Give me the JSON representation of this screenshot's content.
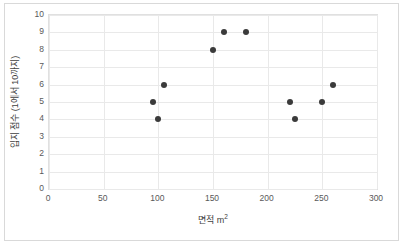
{
  "chart_data": {
    "type": "scatter",
    "title": "",
    "xlabel": "면적 m²",
    "xlabel_base": "면적 m",
    "xlabel_sup": "2",
    "ylabel": "입지 점수 (1에서 10까지)",
    "xlim": [
      0,
      300
    ],
    "ylim": [
      0,
      10
    ],
    "xticks": [
      0,
      50,
      100,
      150,
      200,
      250,
      300
    ],
    "yticks": [
      0,
      1,
      2,
      3,
      4,
      5,
      6,
      7,
      8,
      9,
      10
    ],
    "grid": true,
    "legend": "none",
    "series": [
      {
        "name": "입지 점수",
        "marker": "circle",
        "color": "#3b3b3b",
        "points": [
          {
            "x": 95,
            "y": 5
          },
          {
            "x": 100,
            "y": 4
          },
          {
            "x": 105,
            "y": 6
          },
          {
            "x": 150,
            "y": 8
          },
          {
            "x": 160,
            "y": 9
          },
          {
            "x": 180,
            "y": 9
          },
          {
            "x": 220,
            "y": 5
          },
          {
            "x": 225,
            "y": 4
          },
          {
            "x": 250,
            "y": 5
          },
          {
            "x": 260,
            "y": 6
          }
        ]
      }
    ],
    "colors": {
      "marker": "#3b3b3b",
      "gridline": "#e9e9e9",
      "plot_border": "#e0e0e0",
      "outer_border": "#d9d9d9",
      "tick_text": "#595959",
      "axis_title_text": "#404040",
      "background": "#ffffff"
    }
  }
}
